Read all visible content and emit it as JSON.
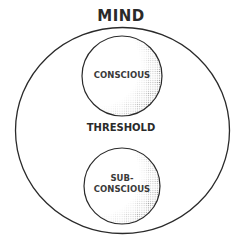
{
  "diagram": {
    "title": "MIND",
    "outer_circle": {
      "label": "MIND",
      "cx": 122,
      "cy": 130,
      "r": 106
    },
    "middle_label": "THRESHOLD",
    "nodes": [
      {
        "id": "conscious",
        "label": "CONSCIOUS",
        "cx": 122,
        "cy": 76,
        "r": 40
      },
      {
        "id": "subconscious",
        "label_line1": "SUB-",
        "label_line2": "CONSCIOUS",
        "cx": 122,
        "cy": 186,
        "r": 38
      }
    ],
    "colors": {
      "stroke": "#2a2a2a",
      "text": "#2a2a2a",
      "background": "#ffffff",
      "stipple": "#3a3a3a"
    }
  }
}
